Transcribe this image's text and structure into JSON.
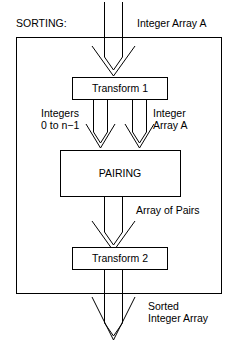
{
  "diagram": {
    "title": "SORTING:",
    "type": "flowchart",
    "outer_frame": {
      "label": "sorting-system-boundary"
    },
    "labels": {
      "input_array": "Integer Array A",
      "integers_range": "Integers\n0 to n−1",
      "integer_array_a": "Integer\nArray A",
      "array_of_pairs": "Array of Pairs",
      "sorted_output": "Sorted\nInteger Array"
    },
    "nodes": [
      {
        "id": "transform1",
        "label": "Transform 1"
      },
      {
        "id": "pairing",
        "label": "PAIRING"
      },
      {
        "id": "transform2",
        "label": "Transform 2"
      }
    ],
    "colors": {
      "stroke": "#000000",
      "background": "#ffffff",
      "text": "#000000"
    }
  }
}
